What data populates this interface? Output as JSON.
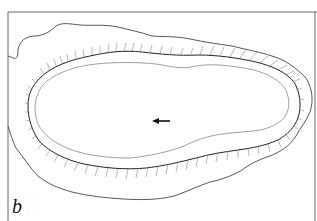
{
  "figure": {
    "panel_label": "b",
    "elements": [
      {
        "name": "outer-outline",
        "type": "irregular closed contour"
      },
      {
        "name": "hatched-margin",
        "type": "contour with radiating hatch marks"
      },
      {
        "name": "inner-outline",
        "type": "thin contour"
      },
      {
        "name": "direction-arrow",
        "direction": "left"
      }
    ],
    "colors": {
      "line": "#333333",
      "hatch": "#777777",
      "frame": "#555555",
      "background": "#ffffff"
    }
  }
}
